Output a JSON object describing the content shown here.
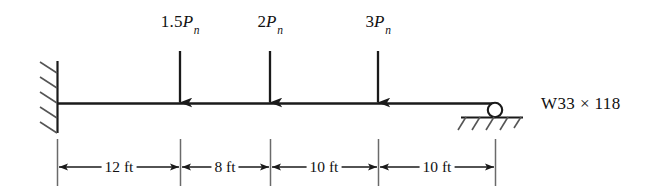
{
  "figure": {
    "type": "structural-beam-diagram",
    "ink_color": "#1a1a1a",
    "background_color": "#ffffff"
  },
  "beam": {
    "span_label": "W33 × 118",
    "section_designation": "W33 × 118",
    "total_length_ft": 40
  },
  "supports": [
    {
      "name": "fixed-wall-support",
      "kind": "fixed",
      "position": "left",
      "station_ft": 0
    },
    {
      "name": "roller-support",
      "kind": "roller",
      "position": "right",
      "station_ft": 40
    }
  ],
  "loads": [
    {
      "id": "load-1",
      "label_parts": {
        "coefficient": "1.5",
        "symbol": "P",
        "subscript": "n"
      },
      "label_text": "1.5Pn",
      "station_ft": 12,
      "direction": "down"
    },
    {
      "id": "load-2",
      "label_parts": {
        "coefficient": "2",
        "symbol": "P",
        "subscript": "n"
      },
      "label_text": "2Pn",
      "station_ft": 20,
      "direction": "down"
    },
    {
      "id": "load-3",
      "label_parts": {
        "coefficient": "3",
        "symbol": "P",
        "subscript": "n"
      },
      "label_text": "3Pn",
      "station_ft": 30,
      "direction": "down"
    }
  ],
  "dimensions": [
    {
      "id": "dim-1",
      "label": "12 ft",
      "value": 12,
      "unit": "ft",
      "from_ft": 0,
      "to_ft": 12
    },
    {
      "id": "dim-2",
      "label": "8 ft",
      "value": 8,
      "unit": "ft",
      "from_ft": 12,
      "to_ft": 20
    },
    {
      "id": "dim-3",
      "label": "10 ft",
      "value": 10,
      "unit": "ft",
      "from_ft": 20,
      "to_ft": 30
    },
    {
      "id": "dim-4",
      "label": "10 ft",
      "value": 10,
      "unit": "ft",
      "from_ft": 30,
      "to_ft": 40
    }
  ]
}
